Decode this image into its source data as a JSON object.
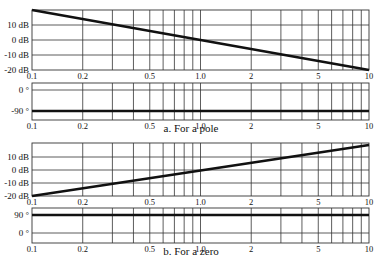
{
  "captions": {
    "a": "a. For a pole",
    "b": "b. For a zero"
  },
  "colors": {
    "grid": "#333333",
    "curve": "#111111",
    "background": "#ffffff"
  },
  "chart_data": [
    {
      "type": "line",
      "id": "pole-magnitude",
      "title": "",
      "xscale": "log",
      "xlim": [
        0.1,
        10
      ],
      "x_ticks": [
        0.1,
        0.2,
        0.5,
        1.0,
        2,
        5,
        10
      ],
      "x_tick_labels": [
        "0.1",
        "0.2",
        "0.5",
        "1.0",
        "2",
        "5",
        "10"
      ],
      "ylim": [
        -20,
        20
      ],
      "y_ticks": [
        10,
        0,
        -10,
        -20
      ],
      "y_tick_labels": [
        "10 dB",
        "0 dB",
        "-10 dB",
        "-20 dB"
      ],
      "grid": true,
      "series": [
        {
          "name": "magnitude",
          "x": [
            0.1,
            10
          ],
          "y": [
            20,
            -20
          ]
        }
      ]
    },
    {
      "type": "line",
      "id": "pole-phase",
      "xscale": "log",
      "xlim": [
        0.1,
        10
      ],
      "x_ticks": [
        0.1,
        0.2,
        0.5,
        1.0,
        2,
        5,
        10
      ],
      "x_tick_labels": [
        "0.1",
        "0.2",
        "0.5",
        "1.0",
        "2",
        "5",
        "10"
      ],
      "ylim": [
        -120,
        20
      ],
      "y_ticks": [
        0,
        -90
      ],
      "y_tick_labels": [
        "0 °",
        "-90 °"
      ],
      "grid": true,
      "series": [
        {
          "name": "phase",
          "x": [
            0.1,
            10
          ],
          "y": [
            -90,
            -90
          ]
        }
      ],
      "caption": "a. For a pole"
    },
    {
      "type": "line",
      "id": "zero-magnitude",
      "xscale": "log",
      "xlim": [
        0.1,
        10
      ],
      "x_ticks": [
        0.1,
        0.2,
        0.5,
        1.0,
        2,
        5,
        10
      ],
      "x_tick_labels": [
        "0.1",
        "0.2",
        "0.5",
        "1.0",
        "2",
        "5",
        "10"
      ],
      "ylim": [
        -20,
        20
      ],
      "y_ticks": [
        10,
        0,
        -10,
        -20
      ],
      "y_tick_labels": [
        "10 dB",
        "0 dB",
        "-10 dB",
        "-20 dB"
      ],
      "grid": true,
      "series": [
        {
          "name": "magnitude",
          "x": [
            0.1,
            10
          ],
          "y": [
            -20,
            20
          ]
        }
      ]
    },
    {
      "type": "line",
      "id": "zero-phase",
      "xscale": "log",
      "xlim": [
        0.1,
        10
      ],
      "x_ticks": [
        0.1,
        0.2,
        0.5,
        1.0,
        2,
        5,
        10
      ],
      "x_tick_labels": [
        "0.1",
        "0.2",
        "0.5",
        "1.0",
        "2",
        "5",
        "10"
      ],
      "ylim": [
        -30,
        110
      ],
      "y_ticks": [
        90,
        0
      ],
      "y_tick_labels": [
        "90 °",
        "0 °"
      ],
      "grid": true,
      "series": [
        {
          "name": "phase",
          "x": [
            0.1,
            10
          ],
          "y": [
            90,
            90
          ]
        }
      ],
      "caption": "b. For a zero"
    }
  ],
  "layout": {
    "plots": [
      {
        "id": "pole-magnitude",
        "x0": 32,
        "x1": 369,
        "y0": 10,
        "y1": 70,
        "ylabels_y": [
          25,
          40,
          55,
          70
        ],
        "gridY": [
          25,
          40,
          55
        ]
      },
      {
        "id": "pole-phase",
        "x0": 32,
        "x1": 369,
        "y0": 83,
        "y1": 120,
        "ylabels_y": [
          90,
          111
        ],
        "gridY": [
          90
        ]
      },
      {
        "id": "zero-magnitude",
        "x0": 32,
        "x1": 369,
        "y0": 143,
        "y1": 196,
        "ylabels_y": [
          157,
          170,
          183,
          196
        ],
        "gridY": [
          157,
          170,
          183
        ]
      },
      {
        "id": "zero-phase",
        "x0": 32,
        "x1": 369,
        "y0": 208,
        "y1": 243,
        "ylabels_y": [
          215,
          233
        ],
        "gridY": [
          233
        ]
      }
    ]
  }
}
